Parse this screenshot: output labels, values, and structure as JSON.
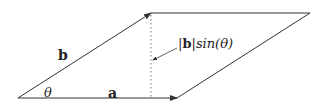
{
  "diagram": {
    "labels": {
      "a": "a",
      "b": "b",
      "theta": "θ",
      "height_bar_open": "|",
      "height_b": "b",
      "height_bar_close": "|",
      "height_sin": "sin(θ)"
    },
    "colors": {
      "stroke": "#333333",
      "dotted": "#777777",
      "background": "#ffffff"
    }
  }
}
